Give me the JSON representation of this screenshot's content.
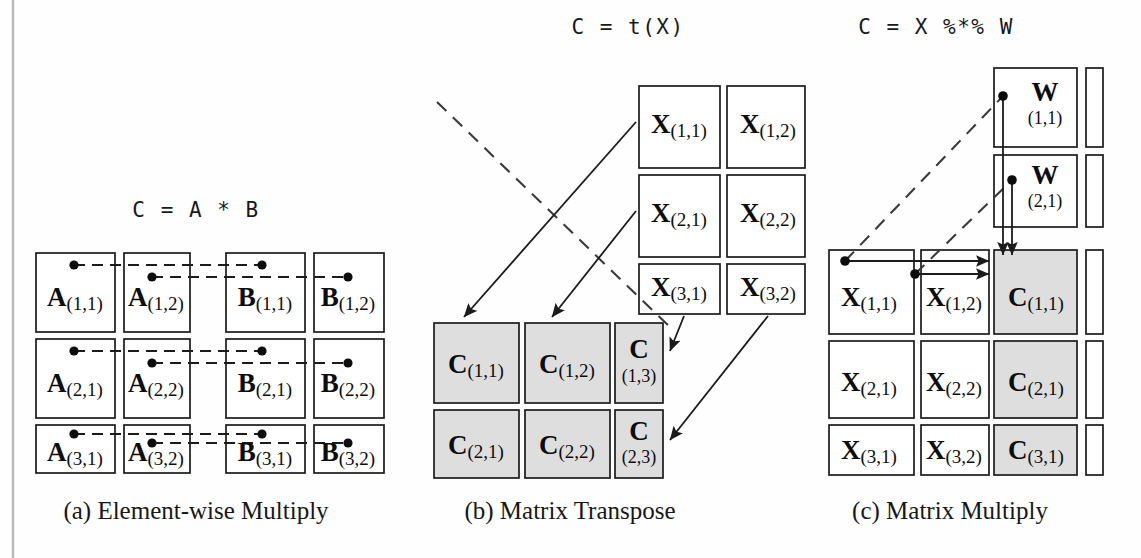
{
  "figure": {
    "width": 1141,
    "height": 558,
    "background": "#fefefe",
    "ink": "#1b1b1b",
    "shaded_fill": "#dedede"
  },
  "panels": [
    {
      "id": "a",
      "title": "C = A * B",
      "caption": "(a) Element-wise Multiply",
      "matrices": [
        {
          "name": "A",
          "cells": [
            {
              "base": "A",
              "sub": "(1,1)"
            },
            {
              "base": "A",
              "sub": "(1,2)"
            },
            {
              "base": "A",
              "sub": "(2,1)"
            },
            {
              "base": "A",
              "sub": "(2,2)"
            },
            {
              "base": "A",
              "sub": "(3,1)"
            },
            {
              "base": "A",
              "sub": "(3,2)"
            }
          ]
        },
        {
          "name": "B",
          "cells": [
            {
              "base": "B",
              "sub": "(1,1)"
            },
            {
              "base": "B",
              "sub": "(1,2)"
            },
            {
              "base": "B",
              "sub": "(2,1)"
            },
            {
              "base": "B",
              "sub": "(2,2)"
            },
            {
              "base": "B",
              "sub": "(3,1)"
            },
            {
              "base": "B",
              "sub": "(3,2)"
            }
          ]
        }
      ]
    },
    {
      "id": "b",
      "title": "C = t(X)",
      "caption": "(b) Matrix Transpose",
      "matrices": [
        {
          "name": "X",
          "cells": [
            {
              "base": "X",
              "sub": "(1,1)"
            },
            {
              "base": "X",
              "sub": "(1,2)"
            },
            {
              "base": "X",
              "sub": "(2,1)"
            },
            {
              "base": "X",
              "sub": "(2,2)"
            },
            {
              "base": "X",
              "sub": "(3,1)"
            },
            {
              "base": "X",
              "sub": "(3,2)"
            }
          ]
        },
        {
          "name": "C",
          "cells": [
            {
              "base": "C",
              "sub": "(1,1)"
            },
            {
              "base": "C",
              "sub": "(1,2)"
            },
            {
              "base": "C",
              "sub": "(1,3)"
            },
            {
              "base": "C",
              "sub": "(2,1)"
            },
            {
              "base": "C",
              "sub": "(2,2)"
            },
            {
              "base": "C",
              "sub": "(2,3)"
            }
          ]
        }
      ]
    },
    {
      "id": "c",
      "title": "C = X %*% W",
      "caption": "(c) Matrix Multiply",
      "matrices": [
        {
          "name": "W",
          "cells": [
            {
              "base": "W",
              "sub": "(1,1)"
            },
            {
              "base": "W",
              "sub": "(2,1)"
            }
          ]
        },
        {
          "name": "X",
          "cells": [
            {
              "base": "X",
              "sub": "(1,1)"
            },
            {
              "base": "X",
              "sub": "(1,2)"
            },
            {
              "base": "X",
              "sub": "(2,1)"
            },
            {
              "base": "X",
              "sub": "(2,2)"
            },
            {
              "base": "X",
              "sub": "(3,1)"
            },
            {
              "base": "X",
              "sub": "(3,2)"
            }
          ]
        },
        {
          "name": "C",
          "cells": [
            {
              "base": "C",
              "sub": "(1,1)"
            },
            {
              "base": "C",
              "sub": "(2,1)"
            },
            {
              "base": "C",
              "sub": "(3,1)"
            }
          ]
        }
      ]
    }
  ],
  "cell_text": {
    "a_1": {
      "base": "A",
      "sub": "(1,1)"
    },
    "a_2": {
      "base": "A",
      "sub": "(1,2)"
    },
    "a_3": {
      "base": "B",
      "sub": "(1,1)"
    },
    "a_4": {
      "base": "B",
      "sub": "(1,2)"
    },
    "a_5": {
      "base": "A",
      "sub": "(2,1)"
    },
    "a_6": {
      "base": "A",
      "sub": "(2,2)"
    },
    "a_7": {
      "base": "B",
      "sub": "(2,1)"
    },
    "a_8": {
      "base": "B",
      "sub": "(2,2)"
    },
    "a_9": {
      "base": "A",
      "sub": "(3,1)"
    },
    "a_10": {
      "base": "A",
      "sub": "(3,2)"
    },
    "a_11": {
      "base": "B",
      "sub": "(3,1)"
    },
    "a_12": {
      "base": "B",
      "sub": "(3,2)"
    },
    "b_x1": {
      "base": "X",
      "sub": "(1,1)"
    },
    "b_x2": {
      "base": "X",
      "sub": "(1,2)"
    },
    "b_x3": {
      "base": "X",
      "sub": "(2,1)"
    },
    "b_x4": {
      "base": "X",
      "sub": "(2,2)"
    },
    "b_x5": {
      "base": "X",
      "sub": "(3,1)"
    },
    "b_x6": {
      "base": "X",
      "sub": "(3,2)"
    },
    "b_c1": {
      "base": "C",
      "sub": "(1,1)"
    },
    "b_c2": {
      "base": "C",
      "sub": "(1,2)"
    },
    "b_c3": {
      "base": "C",
      "sub": "(1,3)"
    },
    "b_c4": {
      "base": "C",
      "sub": "(2,1)"
    },
    "b_c5": {
      "base": "C",
      "sub": "(2,2)"
    },
    "b_c6": {
      "base": "C",
      "sub": "(2,3)"
    },
    "c_w1": {
      "base": "W",
      "sub": "(1,1)"
    },
    "c_w2": {
      "base": "W",
      "sub": "(2,1)"
    },
    "c_x1": {
      "base": "X",
      "sub": "(1,1)"
    },
    "c_x2": {
      "base": "X",
      "sub": "(1,2)"
    },
    "c_x3": {
      "base": "X",
      "sub": "(2,1)"
    },
    "c_x4": {
      "base": "X",
      "sub": "(2,2)"
    },
    "c_x5": {
      "base": "X",
      "sub": "(3,1)"
    },
    "c_x6": {
      "base": "X",
      "sub": "(3,2)"
    },
    "c_c1": {
      "base": "C",
      "sub": "(1,1)"
    },
    "c_c2": {
      "base": "C",
      "sub": "(2,1)"
    },
    "c_c3": {
      "base": "C",
      "sub": "(3,1)"
    }
  },
  "titles": {
    "a": "C = A * B",
    "b": "C = t(X)",
    "c": "C = X %*% W"
  },
  "captions": {
    "a": "(a) Element-wise Multiply",
    "b": "(b) Matrix Transpose",
    "c": "(c) Matrix Multiply"
  }
}
